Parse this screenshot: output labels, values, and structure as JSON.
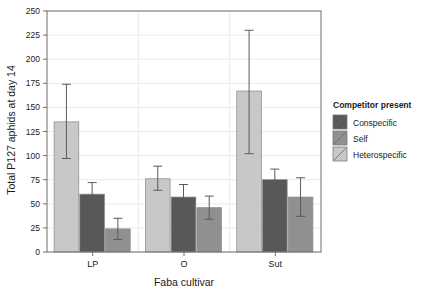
{
  "chart_data": {
    "type": "bar",
    "title": "",
    "xlabel": "Faba cultivar",
    "ylabel": "Total P127 aphids at day 14",
    "categories": [
      "LP",
      "O",
      "Sut"
    ],
    "ylim": [
      0,
      250
    ],
    "yticks": [
      0,
      25,
      50,
      75,
      100,
      125,
      150,
      175,
      200,
      225,
      250
    ],
    "ytick_labels": [
      "0",
      "25",
      "50",
      "75",
      "100",
      "125",
      "150",
      "175",
      "200",
      "225",
      "250"
    ],
    "grid": true,
    "legend_position": "right",
    "legend_title": "Competitor present",
    "series": [
      {
        "name": "Conspecific",
        "color": "#585858",
        "values": [
          60,
          57,
          75
        ],
        "err_low": [
          48,
          46,
          64
        ],
        "err_high": [
          72,
          70,
          86
        ]
      },
      {
        "name": "Self",
        "color": "#909090",
        "values": [
          24,
          46,
          57
        ],
        "err_low": [
          13,
          34,
          37
        ],
        "err_high": [
          35,
          58,
          77
        ]
      },
      {
        "name": "Heterospecific",
        "color": "#c8c8c8",
        "values": [
          135,
          76,
          167
        ],
        "err_low": [
          97,
          64,
          102
        ],
        "err_high": [
          174,
          89,
          230
        ]
      }
    ],
    "bar_order": [
      "Heterospecific",
      "Conspecific",
      "Self"
    ]
  },
  "colors": {
    "panel_border": "#6e6e6e",
    "grid": "#ebebeb",
    "bar_edge": "#8a8a8a",
    "error_bar": "#5a5a5a",
    "text": "#1a1a1a",
    "background": "#ffffff"
  }
}
